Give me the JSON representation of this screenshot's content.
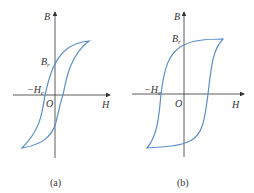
{
  "figures": [
    {
      "caption": "(a)",
      "axis_labels": {
        "y": "B",
        "x": "H",
        "origin": "O",
        "remanence": "B",
        "remanence_sub": "r",
        "coercive": "−H",
        "coercive_sub": "c"
      }
    },
    {
      "caption": "(b)",
      "axis_labels": {
        "y": "B",
        "x": "H",
        "origin": "O",
        "remanence": "B",
        "remanence_sub": "r",
        "coercive": "−H",
        "coercive_sub": "c"
      }
    }
  ],
  "colors": {
    "loop": "#5b8fc9",
    "axis": "#333333"
  }
}
